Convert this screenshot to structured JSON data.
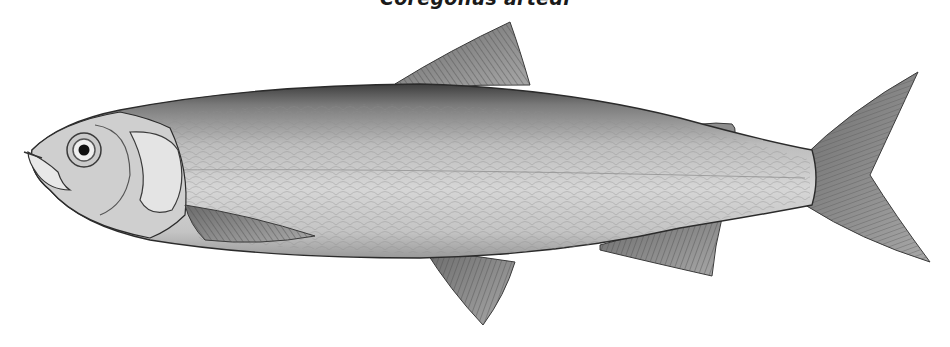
{
  "illustration": {
    "caption": "Coregonus artedi",
    "subject": "fish-illustration",
    "style": "grayscale engraving",
    "colors": {
      "background": "#ffffff",
      "body_light": "#d9d9d9",
      "body_mid": "#b5b5b5",
      "body_dark": "#5a5a5a",
      "fin": "#9a9a9a",
      "outline": "#2b2b2b"
    }
  }
}
